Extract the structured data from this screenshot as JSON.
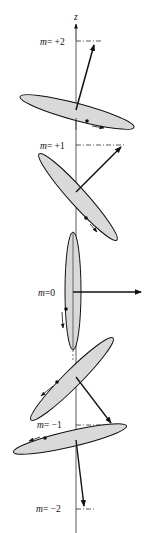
{
  "diagram": {
    "axis_label": "z",
    "colors": {
      "ink": "#111111",
      "disk_fill": "#d9d9d9",
      "background": "#ffffff"
    },
    "states": [
      {
        "m_label": "m",
        "eq": "= +2",
        "value": 2
      },
      {
        "m_label": "m",
        "eq": "= +1",
        "value": 1
      },
      {
        "m_label": "m",
        "eq": "=0",
        "value": 0
      },
      {
        "m_label": "m",
        "eq": "= −1",
        "value": -1
      },
      {
        "m_label": "m",
        "eq": "= −2",
        "value": -2
      }
    ]
  }
}
